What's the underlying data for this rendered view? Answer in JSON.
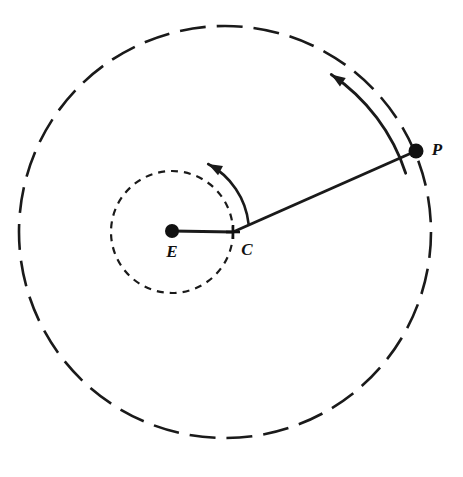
{
  "figure": {
    "kind": "astronomical-epicycle-diagram",
    "background_color": "#ffffff",
    "stroke_color": "#1a1a1a",
    "width": 463,
    "height": 477
  },
  "labels": {
    "earth": "E",
    "epicycle_center": "C",
    "planet": "P"
  },
  "points": [
    {
      "name": "earth",
      "label": "E",
      "marker": "filled-dot",
      "x": 172,
      "y": 231,
      "radius": 7,
      "label_x": 172,
      "label_y": 257
    },
    {
      "name": "epicycle-center",
      "label": "C",
      "marker": "cross",
      "x": 233,
      "y": 232,
      "radius": 7,
      "label_x": 247,
      "label_y": 255
    },
    {
      "name": "planet",
      "label": "P",
      "marker": "filled-dot",
      "x": 416,
      "y": 151,
      "radius": 7.5,
      "label_x": 437,
      "label_y": 155
    }
  ],
  "circles": [
    {
      "name": "deferent-circle",
      "center_x": 172,
      "center_y": 232,
      "radius": 61,
      "style": "dashed",
      "dash": "7 6",
      "stroke_width": 2.2
    },
    {
      "name": "epicycle-circle",
      "center_x": 225,
      "center_y": 232,
      "radius": 206,
      "style": "dashed",
      "dash": "26 11",
      "stroke_width": 2.6
    }
  ],
  "segments": [
    {
      "name": "earth-to-center-line",
      "x1": 172,
      "y1": 231,
      "x2": 233,
      "y2": 232,
      "stroke_width": 3.0
    },
    {
      "name": "center-to-planet-line",
      "x1": 233,
      "y1": 232,
      "x2": 416,
      "y2": 151,
      "stroke_width": 3.0
    }
  ],
  "arrows": [
    {
      "name": "inner-rotation-arrow",
      "direction": "counterclockwise",
      "center_x": 172,
      "center_y": 232,
      "radius": 77,
      "start_angle_deg": 6,
      "end_angle_deg": 62
    },
    {
      "name": "outer-rotation-arrow",
      "direction": "counterclockwise",
      "center_x": 225,
      "center_y": 232,
      "radius": 190,
      "start_angle_deg": 18,
      "end_angle_deg": 56
    }
  ]
}
